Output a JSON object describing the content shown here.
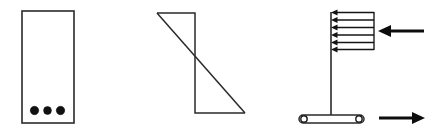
{
  "figure": {
    "canvas": {
      "width": 434,
      "height": 133,
      "background": "#ffffff"
    },
    "stroke_color": "#2a2a2a",
    "fill_color": "#111111",
    "panels": [
      {
        "id": "panel-1",
        "name": "rectangular-plate-with-bolts",
        "type": "rectangle-with-dots",
        "rect": {
          "x": 22,
          "y": 11,
          "width": 52,
          "height": 112
        },
        "dots": [
          {
            "cx": 34.5,
            "cy": 110.5,
            "r": 4.2
          },
          {
            "cx": 47.5,
            "cy": 110.5,
            "r": 3.9
          },
          {
            "cx": 60.5,
            "cy": 110.5,
            "r": 4.2
          }
        ],
        "dot_count": 3
      },
      {
        "id": "panel-2",
        "name": "z-shaped-shear-diagram",
        "type": "polygon",
        "points": [
          {
            "x": 157,
            "y": 13
          },
          {
            "x": 195,
            "y": 13
          },
          {
            "x": 195,
            "y": 113
          },
          {
            "x": 245,
            "y": 113
          }
        ],
        "diagonal": {
          "x1": 157,
          "y1": 13,
          "x2": 245,
          "y2": 113
        }
      },
      {
        "id": "panel-3",
        "name": "loaded-mast-on-rollers",
        "type": "free-body-diagram",
        "mast": {
          "x": 331,
          "y_top": 12,
          "y_bottom": 115
        },
        "load_block": {
          "x_left": 331,
          "x_right": 374,
          "y_top": 12,
          "y_bottom": 50,
          "arrow_count": 6,
          "arrow_direction": "left",
          "arrow_rows": [
            12.5,
            20.0,
            27.5,
            35.0,
            42.5,
            49.5
          ]
        },
        "base_bar": {
          "x_left": 299,
          "x_right": 364,
          "y": 115,
          "height": 8
        },
        "rollers": [
          {
            "cx": 304,
            "cy": 119,
            "rx": 3.4,
            "ry": 3.4
          },
          {
            "cx": 359,
            "cy": 119,
            "rx": 3.4,
            "ry": 3.4
          }
        ],
        "forces": [
          {
            "name": "upper-applied-force",
            "direction": "left",
            "x_tail": 424,
            "x_tip": 379,
            "y": 31
          },
          {
            "name": "lower-reaction-force",
            "direction": "right",
            "x_tail": 379,
            "x_tip": 424,
            "y": 118
          }
        ]
      }
    ]
  }
}
